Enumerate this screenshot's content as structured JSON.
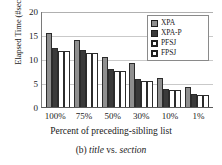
{
  "chart_data": {
    "type": "bar",
    "title": "",
    "xlabel": "Percent of preceding-sibling list",
    "ylabel": "Elapsed Time (#sec)",
    "categories": [
      "100%",
      "75%",
      "50%",
      "30%",
      "10%",
      "1%"
    ],
    "series": [
      {
        "name": "XPA",
        "color": "#8f8f8f",
        "values": [
          15.5,
          13.9,
          10.4,
          9.1,
          6.0,
          4.2
        ]
      },
      {
        "name": "XPA-P",
        "color": "#3a3a3a",
        "values": [
          12.3,
          11.9,
          8.0,
          5.8,
          3.8,
          2.7
        ]
      },
      {
        "name": "PFSJ",
        "color": "#ffffff",
        "values": [
          11.6,
          11.2,
          7.5,
          5.5,
          3.5,
          2.5
        ]
      },
      {
        "name": "FPSJ",
        "color": "#ffffff",
        "values": [
          11.6,
          11.2,
          7.5,
          5.5,
          3.5,
          2.5
        ]
      }
    ],
    "ylim": [
      0,
      20
    ],
    "yticks": [
      "20",
      "15",
      "10",
      "5",
      "0"
    ],
    "ytick_values": [
      20,
      15,
      10,
      5,
      0
    ],
    "grid": true,
    "grid_axis": "y",
    "legend_position": "top-right",
    "legend_entries": [
      "XPA",
      "XPA-P",
      "PFSJ",
      "FPSJ"
    ]
  },
  "caption": {
    "prefix": "(b) ",
    "italic1": "title",
    "middle": " vs. ",
    "italic2": "section"
  }
}
